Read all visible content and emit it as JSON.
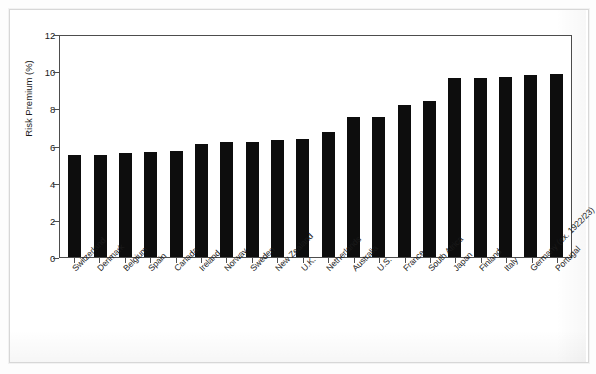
{
  "figure": {
    "background_color": "#ffffff",
    "frame_color": "#d7d7d7",
    "axis_color": "#4d4d4d",
    "bar_color": "#0d0d0d"
  },
  "chart_data": {
    "type": "bar",
    "title": "",
    "subtitle": "",
    "xlabel": "",
    "ylabel": "Risk Premium (%)",
    "ylim": [
      0,
      12
    ],
    "ytick_labels": [
      "0",
      "2",
      "4",
      "6",
      "8",
      "10",
      "12"
    ],
    "ytick_values": [
      0,
      2,
      4,
      6,
      8,
      10,
      12
    ],
    "grid": false,
    "legend": null,
    "legend_position": "none",
    "orientation": "vertical",
    "categories": [
      "Switzerland",
      "Denmark",
      "Belgium",
      "Spain",
      "Canada",
      "Ireland",
      "Norway",
      "Sweden",
      "New Zealand",
      "U.K.",
      "Netherlands",
      "Australia",
      "U.S.",
      "France",
      "South Africa",
      "Japan",
      "Finland",
      "Italy",
      "Germany (ex. 1922/23)",
      "Portugal"
    ],
    "values": [
      5.5,
      5.5,
      5.6,
      5.65,
      5.7,
      6.1,
      6.2,
      6.2,
      6.3,
      6.35,
      6.75,
      7.55,
      7.55,
      8.2,
      8.4,
      9.65,
      9.65,
      9.7,
      9.8,
      9.85
    ]
  }
}
